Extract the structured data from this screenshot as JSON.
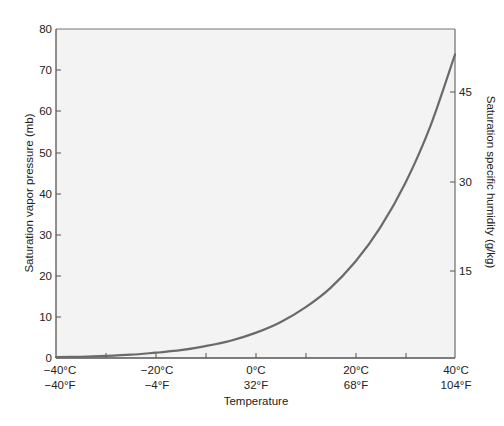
{
  "chart_data": {
    "type": "line",
    "title": "",
    "xlabel": "Temperature",
    "ylabel": "Saturation vapor pressure (mb)",
    "y2label": "Saturation specific humidity (g/kg)",
    "x": [
      -40,
      -35,
      -30,
      -25,
      -20,
      -15,
      -10,
      -5,
      0,
      5,
      10,
      15,
      20,
      25,
      30,
      35,
      40
    ],
    "series": [
      {
        "name": "Saturation vapor pressure",
        "values": [
          0.2,
          0.3,
          0.5,
          0.8,
          1.3,
          1.9,
          2.9,
          4.2,
          6.1,
          8.7,
          12.3,
          17.0,
          23.4,
          31.7,
          42.4,
          56.2,
          73.8
        ]
      }
    ],
    "xlim": [
      -40,
      40
    ],
    "ylim": [
      0,
      80
    ],
    "y2lim_ticks": [
      15,
      30,
      45
    ],
    "x_ticks_celsius": [
      "−40°C",
      "−20°C",
      "0°C",
      "20°C",
      "40°C"
    ],
    "x_ticks_fahrenheit": [
      "−40°F",
      "−4°F",
      "32°F",
      "68°F",
      "104°F"
    ],
    "y_ticks": [
      "0",
      "10",
      "20",
      "30",
      "40",
      "50",
      "60",
      "70",
      "80"
    ],
    "y2_ticks": [
      "15",
      "30",
      "45"
    ],
    "grid": false,
    "legend": null,
    "colors": {
      "curve": "#6a6a6a",
      "plot_bg": "#f3f3f3",
      "axis": "#555555"
    }
  },
  "labels": {
    "xlabel": "Temperature",
    "ylabel": "Saturation vapor pressure (mb)",
    "y2label": "Saturation specific humidity (g/kg)",
    "xc": [
      "−40°C",
      "−20°C",
      "0°C",
      "20°C",
      "40°C"
    ],
    "xf": [
      "−40°F",
      "−4°F",
      "32°F",
      "68°F",
      "104°F"
    ],
    "y": [
      "0",
      "10",
      "20",
      "30",
      "40",
      "50",
      "60",
      "70",
      "80"
    ],
    "y2": [
      "15",
      "30",
      "45"
    ]
  }
}
